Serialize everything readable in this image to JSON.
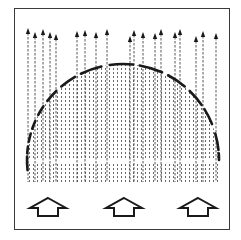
{
  "diagram": {
    "colors": {
      "ink": "#1a1a1a",
      "frame": "#3a3a3a",
      "background": "#ffffff",
      "stipple": "#555555"
    },
    "field_lines": {
      "count_with_arrowheads": 22,
      "x_positions": [
        28,
        35,
        43,
        50,
        56,
        77,
        85,
        96,
        107,
        130,
        134,
        143,
        155,
        161,
        175,
        180,
        196,
        203,
        216
      ],
      "arrowhead_tops_y": [
        28,
        32,
        29,
        32,
        34,
        31,
        30,
        32,
        29,
        36,
        30,
        32,
        33,
        29,
        32,
        29,
        36,
        31,
        33
      ],
      "style": "dashed"
    },
    "dome": {
      "shape": "semicircle",
      "center_x": 123,
      "base_y": 160,
      "radius": 96,
      "edge_style": "dark speckled arc"
    },
    "base_band": {
      "top_y": 164,
      "bottom_y": 182,
      "style": "stippled"
    },
    "hollow_arrows": [
      {
        "name": "arrow-left",
        "center_x": 48
      },
      {
        "name": "arrow-center",
        "center_x": 124
      },
      {
        "name": "arrow-right",
        "center_x": 198
      }
    ],
    "hollow_arrow_direction": "up"
  }
}
